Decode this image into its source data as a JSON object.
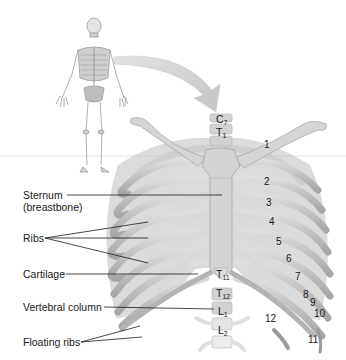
{
  "figure": {
    "colors": {
      "background": "#ffffff",
      "bone": "#c4c4c4",
      "bone_light": "#dcdcdc",
      "bone_dark": "#8e8e8e",
      "cartilage": "#d2d2d2",
      "arrow": "#d0d0d0",
      "horizon_line": "#d6d6d6",
      "text": "#1a1a1a",
      "leader_line": "#1a1a1a"
    }
  },
  "left_labels": [
    {
      "id": "sternum",
      "text": "Sternum",
      "line2": "(breastbone)"
    },
    {
      "id": "ribs",
      "text": "Ribs"
    },
    {
      "id": "cartilage",
      "text": "Cartilage"
    },
    {
      "id": "vertebral",
      "text": "Vertebral column"
    },
    {
      "id": "floating",
      "text": "Floating ribs"
    }
  ],
  "rib_numbers": [
    "1",
    "2",
    "3",
    "4",
    "5",
    "6",
    "7",
    "8",
    "9",
    "10",
    "11",
    "12"
  ],
  "vertebrae": [
    {
      "letter": "C",
      "sub": "7"
    },
    {
      "letter": "T",
      "sub": "1"
    },
    {
      "letter": "T",
      "sub": "11"
    },
    {
      "letter": "T",
      "sub": "12"
    },
    {
      "letter": "L",
      "sub": "1"
    },
    {
      "letter": "L",
      "sub": "2"
    }
  ]
}
